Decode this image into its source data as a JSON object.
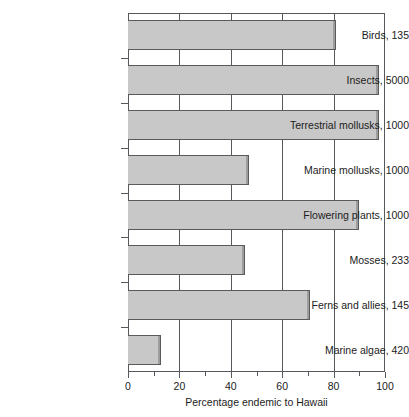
{
  "chart_data": {
    "type": "bar",
    "orientation": "horizontal",
    "title": "",
    "subtitle": "",
    "xlabel": "Percentage endemic to Hawaii",
    "ylabel": "",
    "xlim": [
      0,
      100
    ],
    "xticks": [
      0,
      20,
      40,
      60,
      80,
      100
    ],
    "xticklabels": [
      "0",
      "20",
      "40",
      "60",
      "80",
      "100"
    ],
    "minor_xticks": [
      10,
      30,
      50,
      70,
      90
    ],
    "grid": "vertical gridlines at major x ticks",
    "legend": "none",
    "categories": [
      "Birds, 135",
      "Insects, 5000",
      "Terrestrial mollusks, 1000",
      "Marine mollusks, 1000",
      "Flowering plants, 1000",
      "Mosses, 233",
      "Ferns and allies, 145",
      "Marine algae, 420"
    ],
    "values": [
      81,
      97.5,
      97.5,
      47,
      90,
      45.5,
      71,
      13
    ],
    "bars": [
      {
        "label": "Birds, 135",
        "group": "Birds",
        "count": 135,
        "value": 81
      },
      {
        "label": "Insects, 5000",
        "group": "Insects",
        "count": 5000,
        "value": 97.5
      },
      {
        "label": "Terrestrial mollusks, 1000",
        "group": "Terrestrial mollusks",
        "count": 1000,
        "value": 97.5
      },
      {
        "label": "Marine mollusks, 1000",
        "group": "Marine mollusks",
        "count": 1000,
        "value": 47
      },
      {
        "label": "Flowering plants, 1000",
        "group": "Flowering plants",
        "count": 1000,
        "value": 90
      },
      {
        "label": "Mosses, 233",
        "group": "Mosses",
        "count": 233,
        "value": 45.5
      },
      {
        "label": "Ferns and allies, 145",
        "group": "Ferns and allies",
        "count": 145,
        "value": 71
      },
      {
        "label": "Marine algae, 420",
        "group": "Marine algae",
        "count": 420,
        "value": 13
      }
    ],
    "colors": {
      "bar_fill": "#c8c8c8",
      "bar_edge": "#5a5a5a",
      "axis": "#55585c",
      "text": "#1c1c1c",
      "background": "#ffffff"
    }
  }
}
